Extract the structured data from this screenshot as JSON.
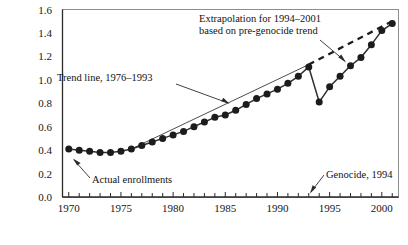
{
  "chart_data": {
    "type": "line",
    "title": "",
    "xlabel": "",
    "ylabel": "",
    "xlim": [
      1969.4,
      2001.6
    ],
    "ylim": [
      0.0,
      1.6
    ],
    "grid": false,
    "legend": "none",
    "y_ticks": [
      "0.0",
      "0.2",
      "0.4",
      "0.6",
      "0.8",
      "1.0",
      "1.2",
      "1.4",
      "1.6"
    ],
    "y_tick_values": [
      0.0,
      0.2,
      0.4,
      0.6,
      0.8,
      1.0,
      1.2,
      1.4,
      1.6
    ],
    "x_ticks_labeled": [
      "1970",
      "1975",
      "1980",
      "1985",
      "1990",
      "1995",
      "2000"
    ],
    "x_tick_values_labeled": [
      1970,
      1975,
      1980,
      1985,
      1990,
      1995,
      2000
    ],
    "x_tick_values_minor": [
      1971,
      1972,
      1973,
      1974,
      1976,
      1977,
      1978,
      1979,
      1981,
      1982,
      1983,
      1984,
      1986,
      1987,
      1988,
      1989,
      1991,
      1992,
      1993,
      1994,
      1996,
      1997,
      1998,
      1999,
      2001
    ],
    "series": [
      {
        "name": "Actual enrollments",
        "style": "solid-with-markers",
        "x": [
          1970,
          1971,
          1972,
          1973,
          1974,
          1975,
          1976,
          1977,
          1978,
          1979,
          1980,
          1981,
          1982,
          1983,
          1984,
          1985,
          1986,
          1987,
          1988,
          1989,
          1990,
          1991,
          1992,
          1993,
          1994,
          1995,
          1996,
          1997,
          1998,
          1999,
          2000,
          2001
        ],
        "values": [
          0.41,
          0.4,
          0.39,
          0.38,
          0.38,
          0.39,
          0.41,
          0.44,
          0.47,
          0.5,
          0.53,
          0.56,
          0.6,
          0.64,
          0.68,
          0.7,
          0.74,
          0.79,
          0.84,
          0.88,
          0.92,
          0.97,
          1.03,
          1.11,
          0.81,
          0.94,
          1.03,
          1.12,
          1.19,
          1.3,
          1.42,
          1.48
        ]
      },
      {
        "name": "Trend line, 1976-1993",
        "style": "thin-solid",
        "x": [
          1976,
          1993
        ],
        "values": [
          0.41,
          1.13
        ]
      },
      {
        "name": "Extrapolation for 1994-2001 based on pre-genocide trend",
        "style": "dashed",
        "x": [
          1993,
          2001
        ],
        "values": [
          1.13,
          1.5
        ]
      }
    ],
    "annotations": [
      {
        "id": "extrapolation-note",
        "text_line_1": "Extrapolation for 1994–2001",
        "text_line_2": "based on pre-genocide trend",
        "points_to_year": 1996,
        "points_to_value": 1.26
      },
      {
        "id": "trend-line-note",
        "text_line_1": "Trend line, 1976–1993",
        "points_to_year": 1988,
        "points_to_value": 0.86
      },
      {
        "id": "actual-enrollments-note",
        "text_line_1": "Actual enrollments",
        "points_to_year": 1971,
        "points_to_value": 0.38
      },
      {
        "id": "genocide-note",
        "text_line_1": "Genocide, 1994",
        "points_to_year": 1994,
        "points_to_value": 0.0
      }
    ]
  }
}
